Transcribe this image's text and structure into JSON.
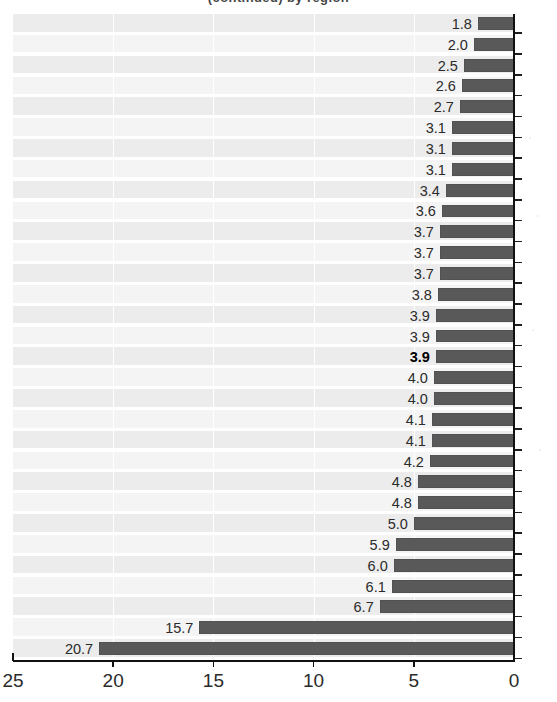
{
  "figure": {
    "title_fragment": "(continued) by region",
    "background_color": "#ffffff",
    "bar_color": "#595959",
    "band_color": "#ececec",
    "band_color_alt": "#f4f4f4",
    "axis_color": "#111111",
    "label_color": "#2b2b2b",
    "highlight_color": "#000000"
  },
  "chart_data": {
    "type": "bar",
    "orientation": "horizontal",
    "title": "",
    "xlabel": "",
    "ylabel": "",
    "xlim": [
      25,
      0
    ],
    "x_axis_reversed": true,
    "x_ticks": [
      25,
      20,
      15,
      10,
      5,
      0
    ],
    "x_tick_labels": [
      "25",
      "20",
      "15",
      "10",
      "5",
      "0"
    ],
    "grid": "vertical",
    "legend": "none",
    "bars_anchored_at": 0,
    "categories": [
      "",
      "",
      "",
      "",
      "",
      "",
      "",
      "",
      "",
      "",
      "",
      "",
      "",
      "",
      "",
      "",
      "",
      "",
      "",
      "",
      "",
      "",
      "",
      "",
      "",
      "",
      "",
      "",
      "",
      "",
      ""
    ],
    "values": [
      1.8,
      2.0,
      2.5,
      2.6,
      2.7,
      3.1,
      3.1,
      3.1,
      3.4,
      3.6,
      3.7,
      3.7,
      3.7,
      3.8,
      3.9,
      3.9,
      3.9,
      4.0,
      4.0,
      4.1,
      4.1,
      4.2,
      4.8,
      4.8,
      5.0,
      5.9,
      6.0,
      6.1,
      6.7,
      15.7,
      20.7
    ],
    "data_labels": [
      "1.8",
      "2.0",
      "2.5",
      "2.6",
      "2.7",
      "3.1",
      "3.1",
      "3.1",
      "3.4",
      "3.6",
      "3.7",
      "3.7",
      "3.7",
      "3.8",
      "3.9",
      "3.9",
      "3.9",
      "4.0",
      "4.0",
      "4.1",
      "4.1",
      "4.2",
      "4.8",
      "4.8",
      "5.0",
      "5.9",
      "6.0",
      "6.1",
      "6.7",
      "15.7",
      "20.7"
    ],
    "highlighted_index": 16,
    "highlighted_label": "3.9",
    "bar_count": 31,
    "sorted": "ascending"
  },
  "axis_bottom": {
    "labels": [
      "25",
      "20",
      "15",
      "10",
      "5",
      "0"
    ]
  }
}
